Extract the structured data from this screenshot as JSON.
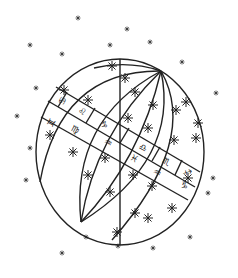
{
  "illustration": {
    "subject": "celestial globe with zodiac band",
    "ink_color": "#222222",
    "background": "#ffffff",
    "zodiac_glyphs": [
      {
        "symbol": "♋",
        "x": 63,
        "y": 101,
        "r": -62
      },
      {
        "symbol": "♊",
        "x": 52,
        "y": 123,
        "r": -62
      },
      {
        "symbol": "♌",
        "x": 82,
        "y": 112,
        "r": 28
      },
      {
        "symbol": "♍",
        "x": 75,
        "y": 130,
        "r": 28
      },
      {
        "symbol": "♑",
        "x": 104,
        "y": 125,
        "r": 28
      },
      {
        "symbol": "♒",
        "x": 108,
        "y": 143,
        "r": 28
      },
      {
        "symbol": "♎",
        "x": 143,
        "y": 148,
        "r": 28
      },
      {
        "symbol": "♓",
        "x": 134,
        "y": 159,
        "r": 28
      },
      {
        "symbol": "♏",
        "x": 166,
        "y": 162,
        "r": 28
      },
      {
        "symbol": "♒",
        "x": 157,
        "y": 173,
        "r": 28
      },
      {
        "symbol": "♐",
        "x": 187,
        "y": 173,
        "r": 28
      },
      {
        "symbol": "♑",
        "x": 184,
        "y": 186,
        "r": 28
      }
    ],
    "globe_stars": [
      [
        112,
        66
      ],
      [
        125,
        78
      ],
      [
        135,
        92
      ],
      [
        153,
        105
      ],
      [
        176,
        110
      ],
      [
        88,
        100
      ],
      [
        64,
        90
      ],
      [
        50,
        135
      ],
      [
        128,
        118
      ],
      [
        148,
        128
      ],
      [
        174,
        140
      ],
      [
        196,
        138
      ],
      [
        105,
        158
      ],
      [
        73,
        152
      ],
      [
        88,
        175
      ],
      [
        110,
        192
      ],
      [
        133,
        175
      ],
      [
        152,
        186
      ],
      [
        172,
        208
      ],
      [
        148,
        218
      ],
      [
        117,
        232
      ],
      [
        135,
        213
      ],
      [
        188,
        178
      ],
      [
        198,
        123
      ],
      [
        186,
        102
      ]
    ],
    "sky_stars": [
      [
        78,
        18
      ],
      [
        127,
        29
      ],
      [
        62,
        54
      ],
      [
        182,
        62
      ],
      [
        110,
        45
      ],
      [
        150,
        42
      ],
      [
        30,
        45
      ],
      [
        36,
        88
      ],
      [
        216,
        93
      ],
      [
        17,
        116
      ],
      [
        26,
        180
      ],
      [
        213,
        178
      ],
      [
        208,
        193
      ],
      [
        86,
        237
      ],
      [
        153,
        248
      ],
      [
        190,
        237
      ],
      [
        118,
        246
      ],
      [
        62,
        253
      ],
      [
        30,
        148
      ]
    ]
  }
}
